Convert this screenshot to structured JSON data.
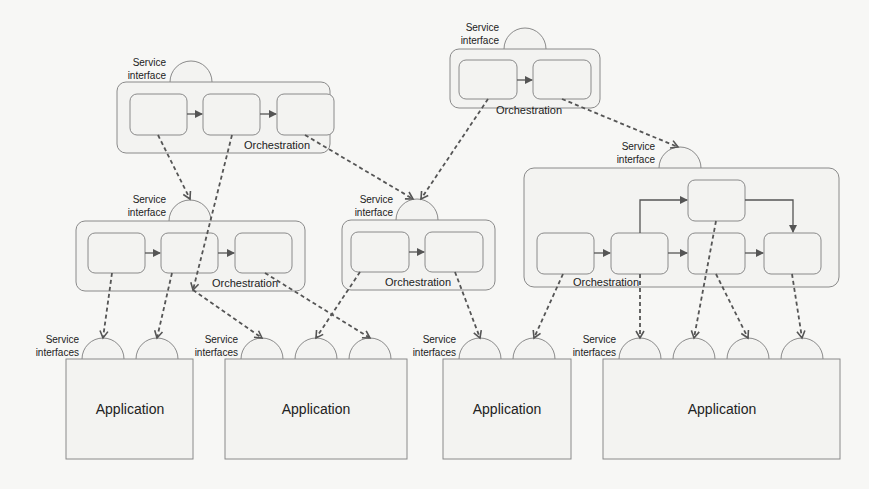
{
  "diagram": {
    "type": "service-orchestration",
    "background": "#f7f7f5",
    "stroke_color": "#777777",
    "dashed_arrow_color": "#555555",
    "orchestrations": [
      {
        "id": "orch-top-left",
        "label": "Orchestration",
        "interface_label": "Service interface",
        "steps": 3
      },
      {
        "id": "orch-top-center",
        "label": "Orchestration",
        "interface_label": "Service interface",
        "steps": 2
      },
      {
        "id": "orch-mid-left",
        "label": "Orchestration",
        "interface_label": "Service interface",
        "steps": 3
      },
      {
        "id": "orch-mid-center",
        "label": "Orchestration",
        "interface_label": "Service interface",
        "steps": 2
      },
      {
        "id": "orch-right",
        "label": "Orchestration",
        "interface_label": "Service interface",
        "steps": 5
      }
    ],
    "applications": [
      {
        "id": "app-1",
        "label": "Application",
        "interfaces_label": "Service interfaces",
        "interfaces": 2
      },
      {
        "id": "app-2",
        "label": "Application",
        "interfaces_label": "Service interfaces",
        "interfaces": 3
      },
      {
        "id": "app-3",
        "label": "Application",
        "interfaces_label": "Service interfaces",
        "interfaces": 2
      },
      {
        "id": "app-4",
        "label": "Application",
        "interfaces_label": "Service interfaces",
        "interfaces": 4
      }
    ],
    "labels": {
      "service": "Service",
      "interface": "interface",
      "interfaces": "interfaces",
      "orchestration": "Orchestration",
      "application": "Application"
    }
  }
}
